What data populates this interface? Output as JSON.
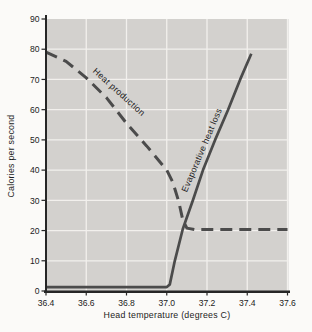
{
  "figure": {
    "background": "#fbfaf8"
  },
  "chart_data": {
    "type": "line",
    "title": "",
    "xlabel": "Head temperature (degrees C)",
    "ylabel": "Calories per second",
    "xlim": [
      36.4,
      37.6
    ],
    "ylim": [
      0,
      90
    ],
    "x_ticks": [
      36.4,
      36.6,
      36.8,
      37.0,
      37.2,
      37.4,
      37.6
    ],
    "x_tick_labels": [
      "36.4",
      "36.6",
      "36.8",
      "37.0",
      "37.2",
      "37.4",
      "37.6"
    ],
    "y_ticks": [
      0,
      10,
      20,
      30,
      40,
      50,
      60,
      70,
      80,
      90
    ],
    "y_tick_labels": [
      "0",
      "10",
      "20",
      "30",
      "40",
      "50",
      "60",
      "70",
      "80",
      "90"
    ],
    "grid": true,
    "legend_position": "inline-curve-labels",
    "colors": {
      "plot_background": "#d3d1ce",
      "gridline": "#f2f0ed",
      "curve": "#4b4b4b",
      "axis": "#262626",
      "text": "#1c1c1c"
    },
    "series": [
      {
        "name": "Heat production",
        "style": "dashed",
        "points": [
          [
            36.4,
            79
          ],
          [
            36.5,
            76
          ],
          [
            36.6,
            70.5
          ],
          [
            36.7,
            64
          ],
          [
            36.8,
            55.5
          ],
          [
            36.9,
            48
          ],
          [
            37.0,
            40
          ],
          [
            37.03,
            36
          ],
          [
            37.06,
            29.5
          ],
          [
            37.08,
            23.5
          ],
          [
            37.1,
            20.8
          ],
          [
            37.14,
            20.3
          ],
          [
            37.6,
            20.3
          ]
        ]
      },
      {
        "name": "Evaporative heat loss",
        "style": "solid",
        "points": [
          [
            36.4,
            1.3
          ],
          [
            37.0,
            1.3
          ],
          [
            37.015,
            2.2
          ],
          [
            37.04,
            10
          ],
          [
            37.08,
            20.5
          ],
          [
            37.13,
            30
          ],
          [
            37.18,
            40
          ],
          [
            37.24,
            50
          ],
          [
            37.305,
            60
          ],
          [
            37.365,
            70
          ],
          [
            37.42,
            78.5
          ]
        ]
      }
    ],
    "annotations": [
      {
        "text": "Heat production",
        "x": 36.63,
        "y": 72.5,
        "angle": 42
      },
      {
        "text": "Evaporative heat loss",
        "x": 37.1,
        "y": 32.5,
        "angle": -67
      }
    ]
  }
}
